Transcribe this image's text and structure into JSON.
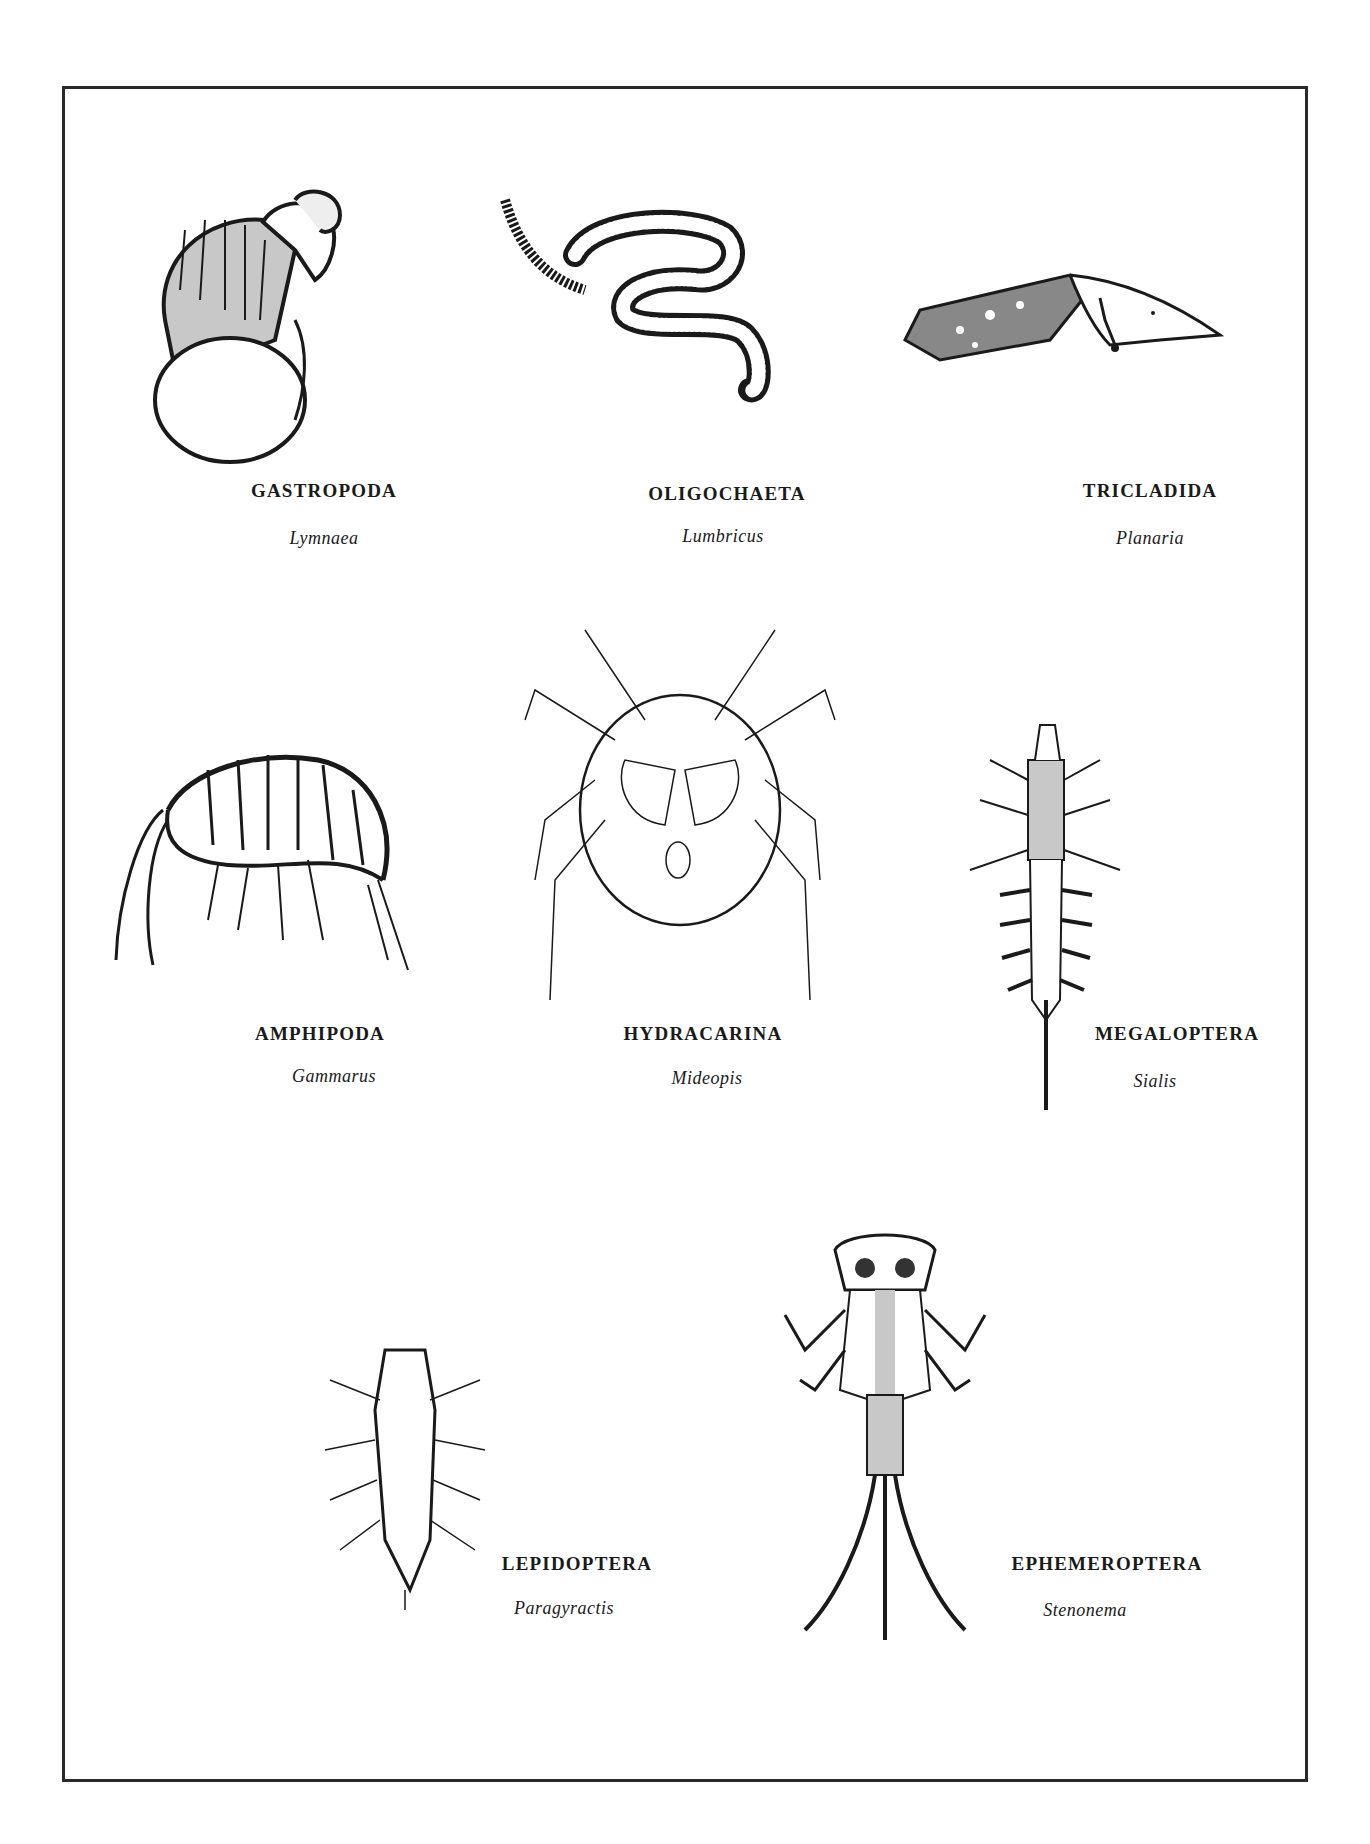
{
  "plate": {
    "specimens": [
      {
        "order": "GASTROPODA",
        "genus": "Lymnaea"
      },
      {
        "order": "OLIGOCHAETA",
        "genus": "Lumbricus"
      },
      {
        "order": "TRICLADIDA",
        "genus": "Planaria"
      },
      {
        "order": "AMPHIPODA",
        "genus": "Gammarus"
      },
      {
        "order": "HYDRACARINA",
        "genus": "Mideopis"
      },
      {
        "order": "MEGALOPTERA",
        "genus": "Sialis"
      },
      {
        "order": "LEPIDOPTERA",
        "genus": "Paragyractis"
      },
      {
        "order": "EPHEMEROPTERA",
        "genus": "Stenonema"
      }
    ]
  },
  "colors": {
    "ink": "#1a1a1a",
    "stipple": "#c8c8c8",
    "paper": "#ffffff"
  }
}
